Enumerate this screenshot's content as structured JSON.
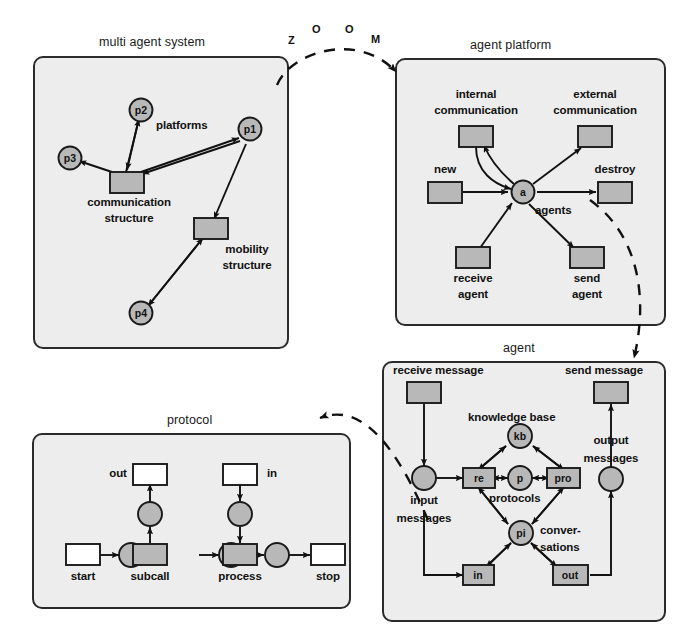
{
  "figure": {
    "zoom_word_letters": [
      "Z",
      "O",
      "O",
      "M"
    ],
    "colors": {
      "panel_fill": "#ededed",
      "panel_border": "#2a2a2a",
      "node_fill": "#b8b8b8",
      "node_border": "#1a1a1a",
      "empty_fill": "#ffffff",
      "edge": "#111111",
      "text": "#111111"
    }
  },
  "panels": [
    {
      "id": "multi-agent-system",
      "title": "multi agent system",
      "nodes": [
        {
          "id": "p2",
          "label": "p2",
          "shape": "circle",
          "inner": "p2"
        },
        {
          "id": "p3",
          "label": "p3",
          "shape": "circle",
          "inner": "p3"
        },
        {
          "id": "p1",
          "label": "p1",
          "shape": "circle",
          "inner": "p1"
        },
        {
          "id": "p4",
          "label": "p4",
          "shape": "circle",
          "inner": "p4"
        },
        {
          "id": "communication-structure",
          "label": "communication\nstructure",
          "shape": "box",
          "inner": ""
        },
        {
          "id": "mobility-structure",
          "label": "mobility\nstructure",
          "shape": "box",
          "inner": ""
        }
      ],
      "labels": {
        "platforms": "platforms",
        "communication_structure_line1": "communication",
        "communication_structure_line2": "structure",
        "mobility_structure_line1": "mobility",
        "mobility_structure_line2": "structure"
      }
    },
    {
      "id": "agent-platform",
      "title": "agent platform",
      "nodes": [
        {
          "id": "internal-communication",
          "label": "internal communication",
          "shape": "box"
        },
        {
          "id": "external-communication",
          "label": "external communication",
          "shape": "box"
        },
        {
          "id": "new",
          "label": "new",
          "shape": "box"
        },
        {
          "id": "destroy",
          "label": "destroy",
          "shape": "box"
        },
        {
          "id": "receive-agent",
          "label": "receive agent",
          "shape": "box"
        },
        {
          "id": "send-agent",
          "label": "send agent",
          "shape": "box"
        },
        {
          "id": "agents",
          "label": "agents",
          "shape": "circle",
          "inner": "a"
        }
      ],
      "labels": {
        "internal_line1": "internal",
        "internal_line2": "communication",
        "external_line1": "external",
        "external_line2": "communication",
        "new": "new",
        "destroy": "destroy",
        "receive_line1": "receive",
        "receive_line2": "agent",
        "send_line1": "send",
        "send_line2": "agent",
        "agents": "agents",
        "agents_inner": "a"
      }
    },
    {
      "id": "agent",
      "title": "agent",
      "nodes": [
        {
          "id": "receive-message",
          "label": "receive message",
          "shape": "box"
        },
        {
          "id": "send-message",
          "label": "send message",
          "shape": "box"
        },
        {
          "id": "input-messages",
          "label": "input messages",
          "shape": "circle"
        },
        {
          "id": "output-messages",
          "label": "output messages",
          "shape": "circle"
        },
        {
          "id": "knowledge-base",
          "label": "knowledge base",
          "shape": "circle",
          "inner": "kb"
        },
        {
          "id": "re",
          "label": "re",
          "shape": "box",
          "inner": "re"
        },
        {
          "id": "protocols",
          "label": "protocols",
          "shape": "circle",
          "inner": "p"
        },
        {
          "id": "pro",
          "label": "pro",
          "shape": "box",
          "inner": "pro"
        },
        {
          "id": "conversations",
          "label": "conversations",
          "shape": "circle",
          "inner": "pi"
        },
        {
          "id": "in",
          "label": "in",
          "shape": "box",
          "inner": "in"
        },
        {
          "id": "out",
          "label": "out",
          "shape": "box",
          "inner": "out"
        }
      ],
      "labels": {
        "receive_message": "receive message",
        "send_message": "send message",
        "knowledge_base": "knowledge base",
        "kb_inner": "kb",
        "re_inner": "re",
        "p_inner": "p",
        "pro_inner": "pro",
        "pi_inner": "pi",
        "in_inner": "in",
        "out_inner": "out",
        "input_line1": "input",
        "input_line2": "messages",
        "output_line1": "output",
        "output_line2": "messages",
        "protocols": "protocols",
        "conversations_line1": "conver-",
        "conversations_line2": "sations"
      }
    },
    {
      "id": "protocol",
      "title": "protocol",
      "nodes": [
        {
          "id": "start",
          "label": "start",
          "shape": "box-empty"
        },
        {
          "id": "subcall",
          "label": "subcall",
          "shape": "box"
        },
        {
          "id": "process",
          "label": "process",
          "shape": "box"
        },
        {
          "id": "stop",
          "label": "stop",
          "shape": "box-empty"
        },
        {
          "id": "out",
          "label": "out",
          "shape": "box-empty"
        },
        {
          "id": "in",
          "label": "in",
          "shape": "box-empty"
        }
      ],
      "labels": {
        "start": "start",
        "subcall": "subcall",
        "process": "process",
        "stop": "stop",
        "out": "out",
        "in": "in"
      }
    }
  ]
}
